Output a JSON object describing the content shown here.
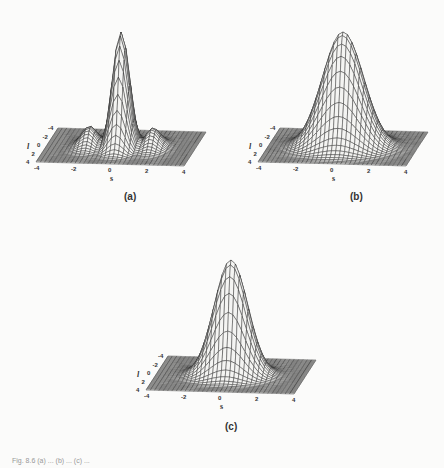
{
  "figure": {
    "caption_fragment": "Fig. 8.6  (a) ... (b) ... (c) ..."
  },
  "panels": [
    {
      "id": "a",
      "label": "(a)"
    },
    {
      "id": "b",
      "label": "(b)"
    },
    {
      "id": "c",
      "label": "(c)"
    }
  ],
  "chart_data": [
    {
      "type": "surface3d",
      "title": "(a)",
      "xlabel": "s",
      "ylabel": "l",
      "x_ticks": [
        "-4",
        "-2",
        "0",
        "2",
        "4"
      ],
      "y_ticks": [
        "-4",
        "-2",
        "0",
        "2",
        "4"
      ],
      "xlim": [
        -4,
        4
      ],
      "ylim": [
        -4,
        4
      ],
      "description": "Gaussian envelope modulated by oscillations along s, producing several sharp ridges/peaks (about 5-7 visible peaks, tallest in center)",
      "surface": {
        "kind": "oscillating_gaussian",
        "sigma": 1.0,
        "frequency": 3.0,
        "peak": 1.0
      },
      "grid": false
    },
    {
      "type": "surface3d",
      "title": "(b)",
      "xlabel": "s",
      "ylabel": "l",
      "x_ticks": [
        "-4",
        "-2",
        "0",
        "2",
        "4"
      ],
      "y_ticks": [
        "-4",
        "-2",
        "0",
        "2",
        "4"
      ],
      "xlim": [
        -4,
        4
      ],
      "ylim": [
        -4,
        4
      ],
      "description": "Broad single Gaussian peak with slight ripple near the apex",
      "surface": {
        "kind": "gaussian",
        "sigma": 1.1,
        "peak": 1.0
      },
      "grid": false
    },
    {
      "type": "surface3d",
      "title": "(c)",
      "xlabel": "s",
      "ylabel": "l",
      "x_ticks": [
        "-4",
        "-2",
        "0",
        "2",
        "4"
      ],
      "y_ticks": [
        "-4",
        "-2",
        "0",
        "2",
        "4"
      ],
      "xlim": [
        -4,
        4
      ],
      "ylim": [
        -4,
        4
      ],
      "description": "Smooth single Gaussian peak, narrower than (b)",
      "surface": {
        "kind": "gaussian",
        "sigma": 0.9,
        "peak": 1.0
      },
      "grid": false
    }
  ]
}
